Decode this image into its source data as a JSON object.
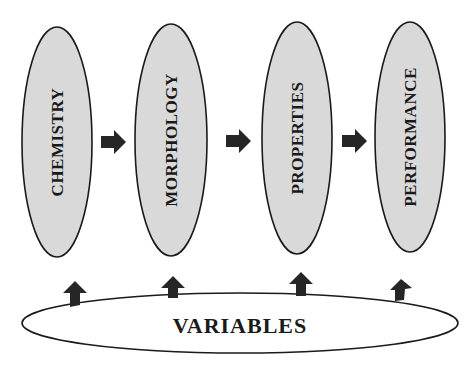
{
  "diagram": {
    "stages": [
      {
        "label": "CHEMISTRY"
      },
      {
        "label": "MORPHOLOGY"
      },
      {
        "label": "PROPERTIES"
      },
      {
        "label": "PERFORMANCE"
      }
    ],
    "base": {
      "label": "VARIABLES"
    },
    "flow": [
      {
        "from": "CHEMISTRY",
        "to": "MORPHOLOGY"
      },
      {
        "from": "MORPHOLOGY",
        "to": "PROPERTIES"
      },
      {
        "from": "PROPERTIES",
        "to": "PERFORMANCE"
      }
    ],
    "influences": [
      {
        "from": "VARIABLES",
        "to": "CHEMISTRY"
      },
      {
        "from": "VARIABLES",
        "to": "MORPHOLOGY"
      },
      {
        "from": "VARIABLES",
        "to": "PROPERTIES"
      },
      {
        "from": "VARIABLES",
        "to": "PERFORMANCE"
      }
    ],
    "colors": {
      "stage_fill": "#d9d9d9",
      "outline": "#1a1a1a",
      "arrow": "#262626",
      "background": "#ffffff"
    }
  }
}
